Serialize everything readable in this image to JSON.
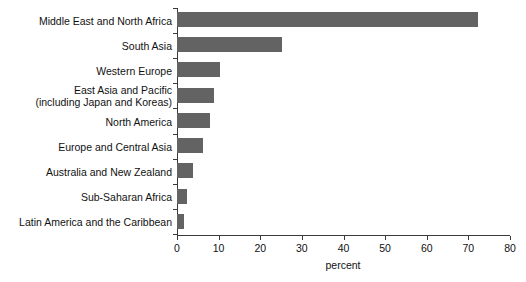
{
  "chart_data": {
    "type": "bar",
    "orientation": "horizontal",
    "title": "",
    "xlabel": "percent",
    "ylabel": "",
    "xlim": [
      0,
      80
    ],
    "xticks": [
      0,
      10,
      20,
      30,
      40,
      50,
      60,
      70,
      80
    ],
    "xtick_labels": [
      "0",
      "10",
      "20",
      "30",
      "40",
      "50",
      "60",
      "70",
      "80"
    ],
    "grid": false,
    "legend": false,
    "bar_color": "#636363",
    "axis_color": "#3a3a3a",
    "categories": [
      "Middle East and North Africa",
      "South Asia",
      "Western Europe",
      "East Asia and Pacific\n(including Japan and Koreas)",
      "North America",
      "Europe and Central Asia",
      "Australia and New Zealand",
      "Sub-Saharan Africa",
      "Latin America and the Caribbean"
    ],
    "values": [
      72.3,
      25.3,
      10.4,
      9.0,
      8.0,
      6.3,
      3.9,
      2.5,
      1.8
    ]
  },
  "rows": [
    {
      "label": "Middle East and North Africa",
      "value": 72.3
    },
    {
      "label": "South Asia",
      "value": 25.3
    },
    {
      "label": "Western Europe",
      "value": 10.4
    },
    {
      "label": "East Asia and Pacific\n(including Japan and Koreas)",
      "value": 9.0
    },
    {
      "label": "North America",
      "value": 8.0
    },
    {
      "label": "Europe and Central Asia",
      "value": 6.3
    },
    {
      "label": "Australia and New Zealand",
      "value": 3.9
    },
    {
      "label": "Sub-Saharan Africa",
      "value": 2.5
    },
    {
      "label": "Latin America and the Caribbean",
      "value": 1.8
    }
  ],
  "axis": {
    "title": "percent",
    "ticks": [
      "0",
      "10",
      "20",
      "30",
      "40",
      "50",
      "60",
      "70",
      "80"
    ]
  }
}
